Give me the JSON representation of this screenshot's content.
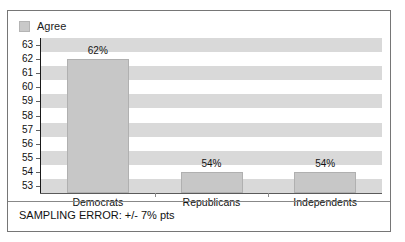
{
  "title_sliver": "PEW RESEARCH CENTER SURVEY",
  "legend": {
    "swatch_name": "legend-swatch-agree",
    "label": "Agree",
    "color": "#c9c9c9"
  },
  "footnote": "SAMPLING ERROR: +/- 7% pts",
  "chart_data": {
    "type": "bar",
    "title": "",
    "xlabel": "",
    "ylabel": "",
    "categories": [
      "Democrats",
      "Republicans",
      "Independents"
    ],
    "values": [
      62,
      54,
      54
    ],
    "data_labels": [
      "62%",
      "54%",
      "54%"
    ],
    "series": [
      {
        "name": "Agree",
        "values": [
          62,
          54,
          54
        ],
        "color": "#c7c7c7"
      }
    ],
    "ylim": [
      53,
      63
    ],
    "yticks": [
      53,
      54,
      55,
      56,
      57,
      58,
      59,
      60,
      61,
      62,
      63
    ],
    "ytick_labels": [
      "53",
      "54",
      "55",
      "56",
      "57",
      "58",
      "59",
      "60",
      "61",
      "62",
      "63"
    ],
    "grid": false,
    "banded_background": true,
    "band_color": "#d9d9d9",
    "legend_position": "top-left"
  }
}
